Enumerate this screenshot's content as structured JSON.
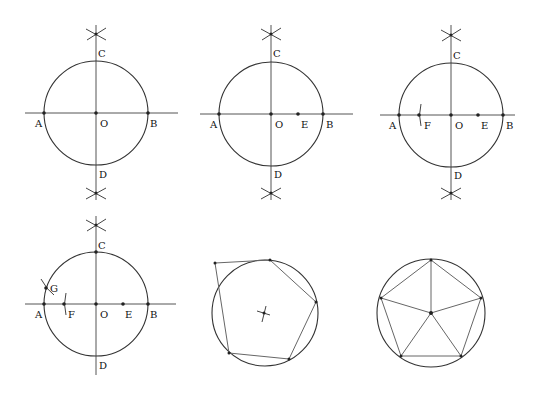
{
  "panels": [
    {
      "step": 1,
      "description": "Circle with center O; perpendicular diameters AB and CD drawn using bisector arcs",
      "center": [
        96,
        113
      ],
      "radius": 52,
      "labels": {
        "A": "A",
        "B": "B",
        "C": "C",
        "D": "D",
        "O": "O"
      }
    },
    {
      "step": 2,
      "description": "E marked as midpoint of OB",
      "center": [
        271,
        114
      ],
      "radius": 52,
      "labels": {
        "A": "A",
        "B": "B",
        "C": "C",
        "D": "D",
        "O": "O",
        "E": "E"
      }
    },
    {
      "step": 3,
      "description": "Arc centered at E with radius EC cuts AO at F",
      "center": [
        451,
        115
      ],
      "radius": 52,
      "labels": {
        "A": "A",
        "B": "B",
        "C": "C",
        "D": "D",
        "O": "O",
        "E": "E",
        "F": "F"
      }
    },
    {
      "step": 4,
      "description": "Distance CF stepped from C gives G on the circle (side length of pentagon)",
      "center": [
        96,
        304
      ],
      "radius": 52,
      "labels": {
        "A": "A",
        "B": "B",
        "C": "C",
        "D": "D",
        "O": "O",
        "E": "E",
        "F": "F",
        "G": "G"
      }
    },
    {
      "step": 5,
      "description": "Regular pentagon inscribed in circle",
      "center": [
        265,
        313
      ],
      "radius": 53,
      "vertices": [
        [
          270,
          260
        ],
        [
          316,
          302
        ],
        [
          289,
          359
        ],
        [
          229,
          353
        ],
        [
          215,
          263
        ]
      ]
    },
    {
      "step": 6,
      "description": "Pentagon with vertices joined to the center",
      "center": [
        431,
        313
      ],
      "radius": 54,
      "vertices": [
        [
          431,
          260
        ],
        [
          481,
          298
        ],
        [
          461,
          356
        ],
        [
          401,
          356
        ],
        [
          381,
          298
        ]
      ]
    }
  ]
}
